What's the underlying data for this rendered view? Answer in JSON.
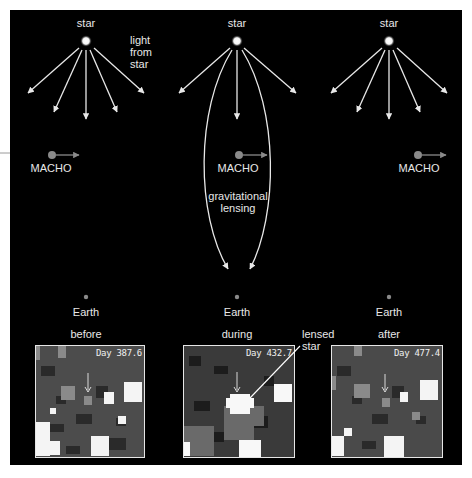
{
  "figure": {
    "background_color": "#000000",
    "foreground_color": "#e8e8e8",
    "macho_color": "#8a8a8a",
    "panels": [
      {
        "id": "before",
        "star_label": "star",
        "note": "light\nfrom\nstar",
        "macho_label": "MACHO",
        "earth_label": "Earth",
        "phase_label": "before",
        "day_label": "Day 387.6"
      },
      {
        "id": "during",
        "star_label": "star",
        "note": "gravitational\nlensing",
        "macho_label": "MACHO",
        "earth_label": "Earth",
        "phase_label": "during",
        "day_label": "Day 432.7",
        "callout": "lensed\nstar"
      },
      {
        "id": "after",
        "star_label": "star",
        "macho_label": "MACHO",
        "earth_label": "Earth",
        "phase_label": "after",
        "day_label": "Day 477.4"
      }
    ]
  }
}
